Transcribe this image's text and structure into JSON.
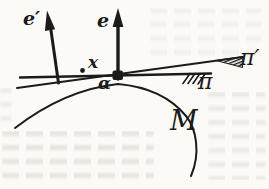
{
  "figure": {
    "type": "hand-drawn-math-diagram",
    "labels": {
      "e_prime": "e′",
      "e": "e",
      "x": "x",
      "alpha": "α",
      "pi": "π",
      "pi_prime": "π′",
      "manifold": "M"
    },
    "colors": {
      "ink": "#1b1b1b",
      "paper": "#fbfaf7",
      "bleed": "#dedcd5"
    }
  }
}
